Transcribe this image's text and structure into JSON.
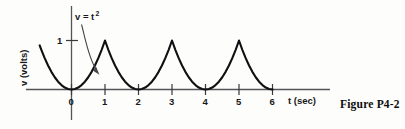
{
  "figure": {
    "caption": "Figure P4-2",
    "equation_base": "v = t",
    "equation_exponent": "2"
  },
  "chart_data": {
    "type": "line",
    "title": "",
    "subtitle": "",
    "xlabel": "t (sec)",
    "ylabel": "v (volts)",
    "xlim": [
      -0.95,
      8.0
    ],
    "ylim": [
      0,
      1.55
    ],
    "grid": false,
    "legend": null,
    "annotations": [
      {
        "text": "v = t^2",
        "target_x": 0.78,
        "target_y": 0.36,
        "label_x": 0.18,
        "label_y": 1.45
      }
    ],
    "xticks": [
      0,
      1,
      2,
      3,
      4,
      5,
      6
    ],
    "xtick_labels": [
      "0",
      "1",
      "2",
      "3",
      "4",
      "5",
      "6"
    ],
    "yticks": [
      1
    ],
    "ytick_labels": [
      "1"
    ],
    "series": [
      {
        "name": "v(t)",
        "x": [
          -0.95,
          -0.9,
          -0.8,
          -0.7,
          -0.6,
          -0.5,
          -0.4,
          -0.3,
          -0.2,
          -0.1,
          0.0,
          0.1,
          0.2,
          0.3,
          0.4,
          0.5,
          0.6,
          0.7,
          0.8,
          0.9,
          1.0,
          1.0,
          1.1,
          1.2,
          1.3,
          1.4,
          1.5,
          1.6,
          1.7,
          1.8,
          1.9,
          2.0,
          2.1,
          2.2,
          2.3,
          2.4,
          2.5,
          2.6,
          2.7,
          2.8,
          2.9,
          3.0,
          3.0,
          3.1,
          3.2,
          3.3,
          3.4,
          3.5,
          3.6,
          3.7,
          3.8,
          3.9,
          4.0,
          4.1,
          4.2,
          4.3,
          4.4,
          4.5,
          4.6,
          4.7,
          4.8,
          4.9,
          5.0,
          5.0,
          5.1,
          5.2,
          5.3,
          5.4,
          5.5,
          5.6,
          5.7,
          5.8,
          5.9,
          6.0
        ],
        "y": [
          0.9,
          0.81,
          0.64,
          0.49,
          0.36,
          0.25,
          0.16,
          0.09,
          0.04,
          0.01,
          0.0,
          0.01,
          0.04,
          0.09,
          0.16,
          0.25,
          0.36,
          0.49,
          0.64,
          0.81,
          1.0,
          1.0,
          0.81,
          0.64,
          0.49,
          0.36,
          0.25,
          0.16,
          0.09,
          0.04,
          0.01,
          0.0,
          0.01,
          0.04,
          0.09,
          0.16,
          0.25,
          0.36,
          0.49,
          0.64,
          0.81,
          1.0,
          1.0,
          0.81,
          0.64,
          0.49,
          0.36,
          0.25,
          0.16,
          0.09,
          0.04,
          0.01,
          0.0,
          0.01,
          0.04,
          0.09,
          0.16,
          0.25,
          0.36,
          0.49,
          0.64,
          0.81,
          1.0,
          1.0,
          0.81,
          0.64,
          0.49,
          0.36,
          0.25,
          0.16,
          0.09,
          0.04,
          0.01,
          0.0
        ]
      }
    ]
  }
}
